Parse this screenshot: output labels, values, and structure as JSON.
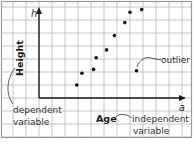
{
  "figure": {
    "type": "scatter-diagram",
    "axes": {
      "x_axis_label": "Age",
      "y_axis_label": "Height",
      "x_variable": "a",
      "y_variable": "h"
    },
    "annotations": {
      "dependent_line1": "dependent",
      "dependent_line2": "variable",
      "independent_line1": "independent",
      "independent_line2": "variable",
      "outlier": "outlier"
    },
    "colors": {
      "grid": "#b8b8b8",
      "axis": "#1a1a1a",
      "points": "#111111",
      "text": "#333333"
    }
  },
  "chart_data": {
    "type": "scatter",
    "title": "",
    "xlabel": "Age",
    "ylabel": "Height",
    "x_variable": "a",
    "y_variable": "h",
    "grid": true,
    "units": "grid squares from origin",
    "points": [
      {
        "x": 2.9,
        "y": 1.0
      },
      {
        "x": 3.3,
        "y": 1.9
      },
      {
        "x": 4.2,
        "y": 2.2
      },
      {
        "x": 4.4,
        "y": 3.1
      },
      {
        "x": 5.2,
        "y": 3.7
      },
      {
        "x": 5.8,
        "y": 4.8
      },
      {
        "x": 6.6,
        "y": 5.8
      },
      {
        "x": 7.0,
        "y": 6.6
      },
      {
        "x": 7.9,
        "y": 6.8
      }
    ],
    "outliers": [
      {
        "x": 7.5,
        "y": 2.1,
        "label": "outlier"
      }
    ],
    "annotations": [
      "dependent variable",
      "independent variable",
      "outlier"
    ]
  }
}
